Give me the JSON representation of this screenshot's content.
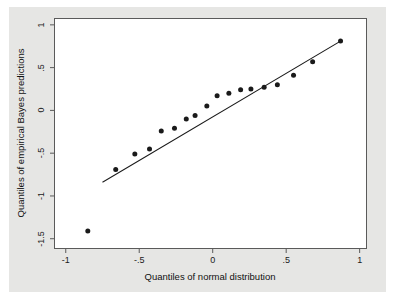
{
  "figure": {
    "kind": "qq-plot",
    "background_color": "#e6e6e4",
    "plot_background_color": "#ffffff",
    "frame_color": "#5a5a5a",
    "marker_color": "#1a1a1a",
    "line_color": "#1a1a1a"
  },
  "chart_data": {
    "type": "scatter",
    "title": "",
    "subtitle": "",
    "xlabel": "Quantiles of normal distribution",
    "ylabel": "Quantiles of empirical Bayes predictions",
    "xlim": [
      -1.08,
      1.05
    ],
    "ylim": [
      -1.62,
      1.08
    ],
    "xticks": [
      -1,
      -0.5,
      0,
      0.5,
      1
    ],
    "xticklabels": [
      "-1",
      "-.5",
      "0",
      ".5",
      "1"
    ],
    "yticks": [
      1,
      0.5,
      0,
      -0.5,
      -1,
      -1.5
    ],
    "yticklabels": [
      "1",
      ".5",
      "0",
      "-.5",
      "-1",
      "-1.5"
    ],
    "grid": false,
    "legend": null,
    "legend_position": "none",
    "marker": "filled-circle",
    "marker_size_px": 5,
    "series": [
      {
        "name": "empirical Bayes predictions",
        "x": [
          -0.85,
          -0.66,
          -0.53,
          -0.43,
          -0.35,
          -0.26,
          -0.18,
          -0.12,
          -0.04,
          0.03,
          0.11,
          0.19,
          0.26,
          0.35,
          0.44,
          0.55,
          0.68,
          0.87
        ],
        "y": [
          -1.41,
          -0.69,
          -0.51,
          -0.45,
          -0.24,
          -0.21,
          -0.1,
          -0.06,
          0.05,
          0.17,
          0.2,
          0.24,
          0.25,
          0.27,
          0.3,
          0.41,
          0.57,
          0.81
        ]
      }
    ],
    "reference_line": {
      "name": "45-degree reference line",
      "x": [
        -0.75,
        0.87
      ],
      "y": [
        -0.84,
        0.81
      ]
    }
  }
}
